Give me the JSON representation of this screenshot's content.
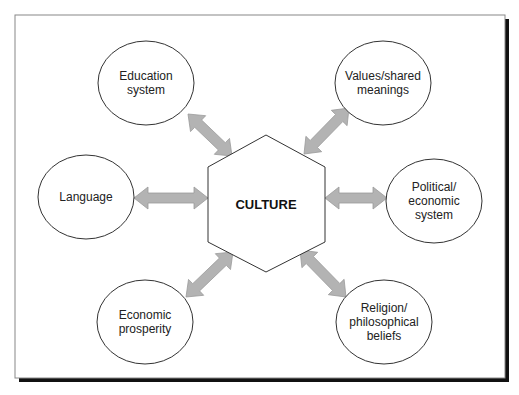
{
  "diagram": {
    "type": "hub-and-spoke concept diagram",
    "center": {
      "id": "culture",
      "label": "CULTURE",
      "shape": "hexagon"
    },
    "nodes": [
      {
        "id": "education",
        "lines": [
          "Education",
          "system"
        ],
        "position": "top-left"
      },
      {
        "id": "values",
        "lines": [
          "Values/shared",
          "meanings"
        ],
        "position": "top-right"
      },
      {
        "id": "language",
        "lines": [
          "Language"
        ],
        "position": "left"
      },
      {
        "id": "political",
        "lines": [
          "Political/",
          "economic",
          "system"
        ],
        "position": "right"
      },
      {
        "id": "prosperity",
        "lines": [
          "Economic",
          "prosperity"
        ],
        "position": "bottom-left"
      },
      {
        "id": "religion",
        "lines": [
          "Religion/",
          "philosophical",
          "beliefs"
        ],
        "position": "bottom-right"
      }
    ],
    "edges": [
      {
        "from": "culture",
        "to": "education",
        "direction": "bidirectional"
      },
      {
        "from": "culture",
        "to": "values",
        "direction": "bidirectional"
      },
      {
        "from": "culture",
        "to": "language",
        "direction": "bidirectional"
      },
      {
        "from": "culture",
        "to": "political",
        "direction": "bidirectional"
      },
      {
        "from": "culture",
        "to": "prosperity",
        "direction": "bidirectional"
      },
      {
        "from": "culture",
        "to": "religion",
        "direction": "bidirectional"
      }
    ],
    "colors": {
      "arrow_fill": "#b3b3b3",
      "arrow_stroke": "#9a9a9a",
      "outline": "#333333",
      "frame": "#888888",
      "shadow": "#111111"
    }
  }
}
